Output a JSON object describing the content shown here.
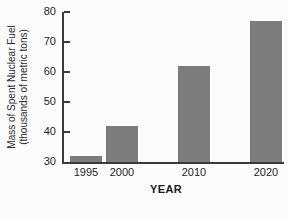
{
  "chart_data": {
    "type": "bar",
    "title": "",
    "xlabel": "YEAR",
    "ylabel": "Mass of Spent Nuclear Fuel (thousands of metric tons)",
    "ylabel_line1": "Mass of Spent Nuclear Fuel",
    "ylabel_line2": "(thousands of metric tons)",
    "categories": [
      "1995",
      "2000",
      "2010",
      "2020"
    ],
    "x_years": [
      1995,
      2000,
      2010,
      2020
    ],
    "values": [
      32,
      42,
      62,
      77
    ],
    "ylim": [
      30,
      80
    ],
    "yticks": [
      80,
      70,
      60,
      50,
      40,
      30
    ],
    "ytick_step": 10,
    "grid": false,
    "legend": false,
    "bar_color": "#7c7c7c",
    "axis_color": "#3a3a3a",
    "text_color": "#1c1c1c"
  }
}
